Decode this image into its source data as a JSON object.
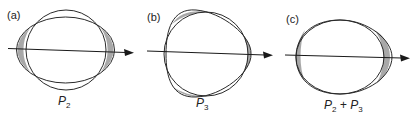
{
  "figure": {
    "colors": {
      "stroke": "#2a2a2a",
      "shade": "#a8a8a8",
      "background": "#ffffff"
    },
    "panels": [
      {
        "id": "a",
        "label": "(a)",
        "caption_main": "P",
        "caption_sub": "2",
        "caption_rest": "",
        "caption_sub2": ""
      },
      {
        "id": "b",
        "label": "(b)",
        "caption_main": "P",
        "caption_sub": "3",
        "caption_rest": "",
        "caption_sub2": ""
      },
      {
        "id": "c",
        "label": "(c)",
        "caption_main": "P",
        "caption_sub": "2",
        "caption_rest": " + P",
        "caption_sub2": "3"
      }
    ]
  }
}
